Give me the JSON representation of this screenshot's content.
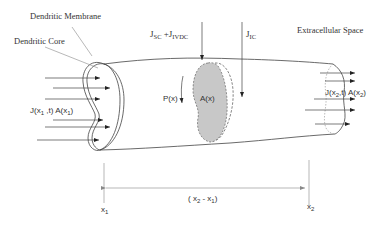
{
  "diagram": {
    "labels": {
      "membrane": "Dendritic Membrane",
      "core": "Dendritic Core",
      "extracellular": "Extracellular Space",
      "flux_sc": "J",
      "flux_sc_sub": "SC",
      "flux_plus": " +J",
      "flux_ivdc_sub": "IVDC",
      "flux_ic": "J",
      "flux_ic_sub": "IC",
      "perimeter": "P(x)",
      "area": "A(x)",
      "inflow_prefix": "J(x",
      "inflow_sub": "1",
      "inflow_mid": " ,t) A(x",
      "inflow_sub2": "1",
      "inflow_end": ")",
      "outflow_prefix": "J(x",
      "outflow_sub": "2",
      "outflow_mid": ",t) A(x",
      "outflow_sub2": "2",
      "outflow_end": ")",
      "x1": "x",
      "x1_sub": "1",
      "x2": "x",
      "x2_sub": "2",
      "span_open": "( x",
      "span_sub1": "2",
      "span_mid": " - x",
      "span_sub2": "1",
      "span_close": ")"
    },
    "colors": {
      "cross_section_fill": "#c8c8c8",
      "stroke": "#444444"
    }
  }
}
